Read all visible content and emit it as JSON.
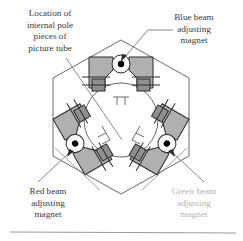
{
  "figure": {
    "labels": {
      "pole_pieces": {
        "lines": [
          "Location of",
          "internal pole",
          "pieces of",
          "picture tube"
        ],
        "color": "#3a3a3a"
      },
      "blue_magnet": {
        "lines": [
          "Blue beam",
          "adjusting",
          "magnet"
        ],
        "color": "#3a3a3a"
      },
      "red_magnet": {
        "lines": [
          "Red beam",
          "adjusting",
          "magnet"
        ],
        "color": "#3a3a3a"
      },
      "green_magnet": {
        "lines": [
          "Green beam",
          "adjusting",
          "magnet"
        ],
        "color": "#b4b4b4"
      }
    },
    "colors": {
      "magnet_fill": "#b0b0b0",
      "magnet_fill_dark": "#8f8f8f",
      "magnet_stroke": "#2b2b2b",
      "hexagon_stroke": "#6a6a6a",
      "circle_stroke": "#6a6a6a",
      "leader_stroke": "#7a7a7a",
      "pivot_dot": "#000000",
      "background": "#ffffff",
      "rule": "#9a9a9a"
    },
    "geometry": {
      "hexagon_center": [
        121,
        117
      ],
      "hexagon_radius": 78,
      "circle_center": [
        121,
        120
      ],
      "circle_radius": 37,
      "magnet_count": 3,
      "magnet_angles_deg": [
        0,
        120,
        240
      ]
    },
    "pivot_dots": [
      {
        "name": "blue-pivot",
        "x": 121,
        "y": 64
      },
      {
        "name": "red-pivot",
        "x": 75,
        "y": 155
      },
      {
        "name": "green-pivot",
        "x": 167,
        "y": 155
      }
    ],
    "pole_marks": [
      "top-center",
      "lower-left",
      "lower-right"
    ],
    "footer_rule": {
      "x1": 10,
      "x2": 236,
      "y": 232
    }
  }
}
